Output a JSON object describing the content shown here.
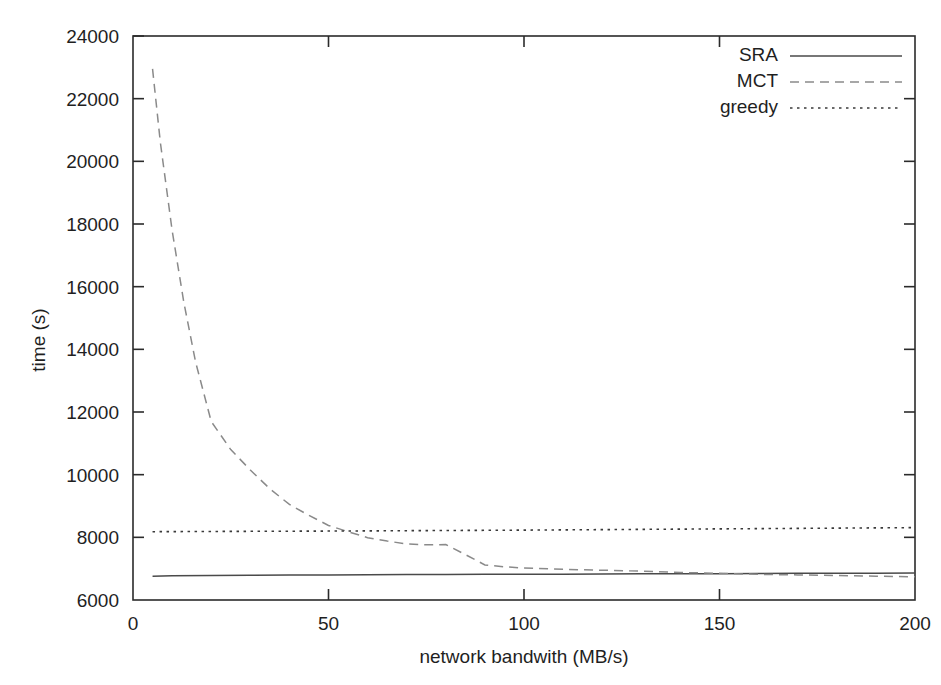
{
  "chart_data": {
    "type": "line",
    "title": "",
    "subtitle": "",
    "xlabel": "network bandwith (MB/s)",
    "ylabel": "time (s)",
    "xlim": [
      0,
      200
    ],
    "ylim": [
      6000,
      24000
    ],
    "xticks": [
      0,
      50,
      100,
      150,
      200
    ],
    "yticks": [
      6000,
      8000,
      10000,
      12000,
      14000,
      16000,
      18000,
      20000,
      22000,
      24000
    ],
    "xtick_labels": [
      "0",
      "50",
      "100",
      "150",
      "200"
    ],
    "ytick_labels": [
      "6000",
      "8000",
      "10000",
      "12000",
      "14000",
      "16000",
      "18000",
      "20000",
      "22000",
      "24000"
    ],
    "grid": false,
    "legend_position": "top-right",
    "series": [
      {
        "name": "SRA",
        "style": "solid",
        "color": "#4a4a4a",
        "x": [
          5,
          10,
          20,
          30,
          40,
          50,
          60,
          70,
          80,
          90,
          100,
          110,
          120,
          130,
          140,
          150,
          160,
          170,
          180,
          190,
          200
        ],
        "values": [
          6760,
          6770,
          6780,
          6790,
          6800,
          6800,
          6805,
          6810,
          6815,
          6820,
          6820,
          6825,
          6830,
          6835,
          6840,
          6840,
          6845,
          6850,
          6850,
          6855,
          6860
        ]
      },
      {
        "name": "MCT",
        "style": "dashed",
        "color": "#8a8a8a",
        "x": [
          5,
          7,
          10,
          13,
          16,
          20,
          25,
          30,
          35,
          40,
          45,
          50,
          55,
          60,
          65,
          70,
          75,
          80,
          85,
          90,
          95,
          100,
          110,
          120,
          130,
          140,
          150,
          160,
          170,
          180,
          190,
          200
        ],
        "values": [
          22950,
          20600,
          17800,
          15500,
          13600,
          11700,
          10800,
          10150,
          9550,
          9050,
          8700,
          8380,
          8180,
          7990,
          7880,
          7790,
          7760,
          7770,
          7450,
          7120,
          7060,
          7020,
          6980,
          6950,
          6920,
          6880,
          6850,
          6820,
          6800,
          6780,
          6760,
          6740
        ]
      },
      {
        "name": "greedy",
        "style": "dotted",
        "color": "#3a3a3a",
        "x": [
          5,
          25,
          50,
          75,
          100,
          125,
          150,
          175,
          200
        ],
        "values": [
          8180,
          8190,
          8200,
          8215,
          8230,
          8250,
          8270,
          8290,
          8310
        ]
      }
    ]
  },
  "legend": {
    "items": [
      {
        "label": "SRA"
      },
      {
        "label": "MCT"
      },
      {
        "label": "greedy"
      }
    ]
  },
  "axes": {
    "x_title": "network bandwith (MB/s)",
    "y_title": "time (s)"
  }
}
